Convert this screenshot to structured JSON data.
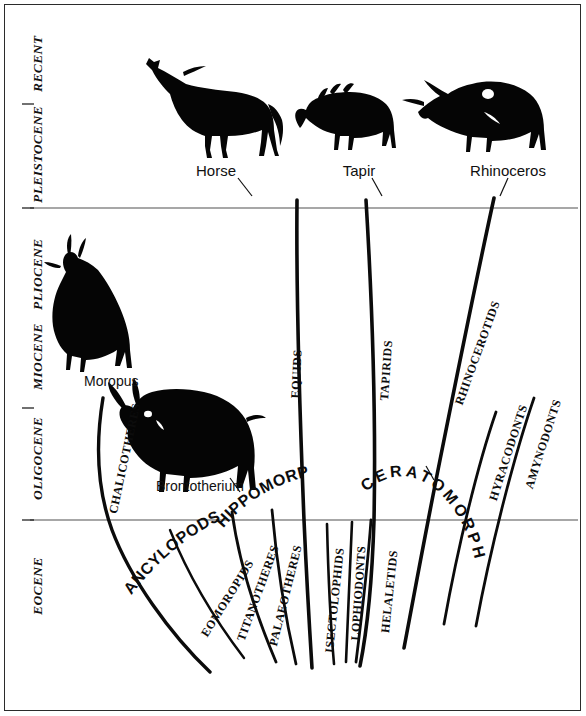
{
  "figure": {
    "background_color": "#ffffff",
    "ink_color": "#0b0b0b",
    "rule_color": "#8a8a8a"
  },
  "time_axis": {
    "orientation": "vertical",
    "direction": "recent-at-top",
    "epochs": [
      {
        "label": "RECENT",
        "y_center": 62
      },
      {
        "label": "PLEISTOCENE",
        "y_center": 148
      },
      {
        "label": "PLIOCENE",
        "y_center": 268
      },
      {
        "label": "MIOCENE",
        "y_center": 352
      },
      {
        "label": "OLIGOCENE",
        "y_center": 452
      },
      {
        "label": "EOCENE",
        "y_center": 585
      }
    ],
    "divider_lines": [
      {
        "y": 208
      },
      {
        "y": 520
      }
    ]
  },
  "living_taxa": [
    {
      "label": "Horse",
      "x": 216,
      "y": 170
    },
    {
      "label": "Tapir",
      "x": 358,
      "y": 170
    },
    {
      "label": "Rhinoceros",
      "x": 507,
      "y": 170
    }
  ],
  "fossil_genera": [
    {
      "label": "Moropus",
      "x": 115,
      "y": 381
    },
    {
      "label": "Brontotherium",
      "x": 158,
      "y": 484
    }
  ],
  "group_labels": [
    {
      "label": "ANCYLOPODS",
      "style": "arc"
    },
    {
      "label": "HIPPOMORPHS",
      "style": "arc"
    },
    {
      "label": "CERATOMORPHS",
      "style": "arc-wide"
    }
  ],
  "lineages": [
    {
      "label": "CHALICOTHERES",
      "group": "ANCYLOPODS",
      "extends_to": "MIOCENE"
    },
    {
      "label": "EOMOROPIDS",
      "group": "ANCYLOPODS",
      "extends_to": "EOCENE"
    },
    {
      "label": "TITANOTHERES",
      "group": "HIPPOMORPHS",
      "extends_to": "OLIGOCENE"
    },
    {
      "label": "PALAEOTHERES",
      "group": "HIPPOMORPHS",
      "extends_to": "OLIGOCENE"
    },
    {
      "label": "EQUIDS",
      "group": "HIPPOMORPHS",
      "extends_to": "RECENT"
    },
    {
      "label": "ISECTOLOPHIDS",
      "group": "CERATOMORPHS",
      "extends_to": "EOCENE"
    },
    {
      "label": "LOPHIODONTS",
      "group": "CERATOMORPHS",
      "extends_to": "EOCENE"
    },
    {
      "label": "HELALETIDS",
      "group": "CERATOMORPHS",
      "extends_to": "EOCENE"
    },
    {
      "label": "TAPIRIDS",
      "group": "CERATOMORPHS",
      "extends_to": "RECENT"
    },
    {
      "label": "RHINOCEROTIDS",
      "group": "CERATOMORPHS",
      "extends_to": "RECENT"
    },
    {
      "label": "HYRACODONTS",
      "group": "CERATOMORPHS",
      "extends_to": "OLIGOCENE"
    },
    {
      "label": "AMYNODONTS",
      "group": "CERATOMORPHS",
      "extends_to": "OLIGOCENE"
    }
  ]
}
